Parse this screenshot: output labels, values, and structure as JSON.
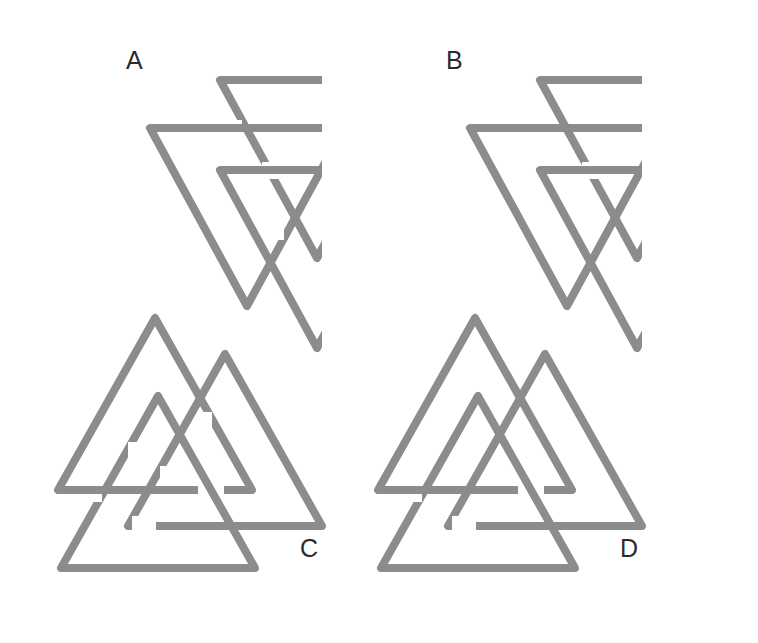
{
  "figure": {
    "background_color": "#ffffff",
    "stroke_color": "#8c8c8c",
    "label_color": "#2b2b2b",
    "stroke_width": 8,
    "panel_count": 4
  },
  "panels": [
    {
      "id": "A",
      "label": "A",
      "orientation": "down",
      "description": "Three downward-pointing triangles in a unicursal interlock",
      "triangles": [
        {
          "name": "upper-right",
          "points": "198,44 392,44 295,222"
        },
        {
          "name": "left",
          "points": "128,92 322,92 225,270"
        },
        {
          "name": "lower-right",
          "points": "198,134 392,134 295,312"
        }
      ]
    },
    {
      "id": "B",
      "label": "B",
      "orientation": "down",
      "description": "Three downward-pointing triangles with alternate over-under crossings",
      "triangles": [
        {
          "name": "upper-right",
          "points": "198,44 392,44 295,222"
        },
        {
          "name": "left",
          "points": "128,92 322,92 225,270"
        },
        {
          "name": "lower-right",
          "points": "198,134 392,134 295,312"
        }
      ]
    },
    {
      "id": "C",
      "label": "C",
      "orientation": "up",
      "description": "Three upward-pointing triangles in a unicursal interlock",
      "triangles": [
        {
          "name": "upper-left",
          "points": "107,18 10,190 204,190"
        },
        {
          "name": "right",
          "points": "177,54 80,226 274,226"
        },
        {
          "name": "lower-left",
          "points": "110,96 13,268 207,268"
        }
      ]
    },
    {
      "id": "D",
      "label": "D",
      "orientation": "up",
      "description": "Three upward-pointing triangles with alternate over-under crossings",
      "triangles": [
        {
          "name": "upper-left",
          "points": "107,18 10,190 204,190"
        },
        {
          "name": "right",
          "points": "177,54 80,226 274,226"
        },
        {
          "name": "lower-left",
          "points": "110,96 13,268 207,268"
        }
      ]
    }
  ],
  "crossings": {
    "A": "alternating over-under (true valknut weave)",
    "B": "variant weave differing from A at two crossings",
    "C": "alternating over-under (true valknut weave)",
    "D": "variant weave differing from C at two crossings"
  }
}
